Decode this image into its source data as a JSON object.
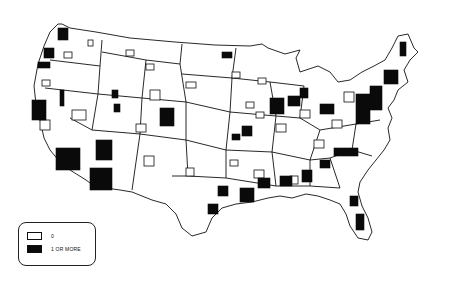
{
  "map": {
    "title": "",
    "region": "Contiguous United States",
    "colors": {
      "zero": "#ffffff",
      "one_or_more": "#0a0a0a",
      "outline": "#111111"
    },
    "legend": {
      "items": [
        {
          "label": "0",
          "color": "#ffffff"
        },
        {
          "label": "1 OR MORE",
          "color": "#0a0a0a"
        }
      ]
    }
  }
}
